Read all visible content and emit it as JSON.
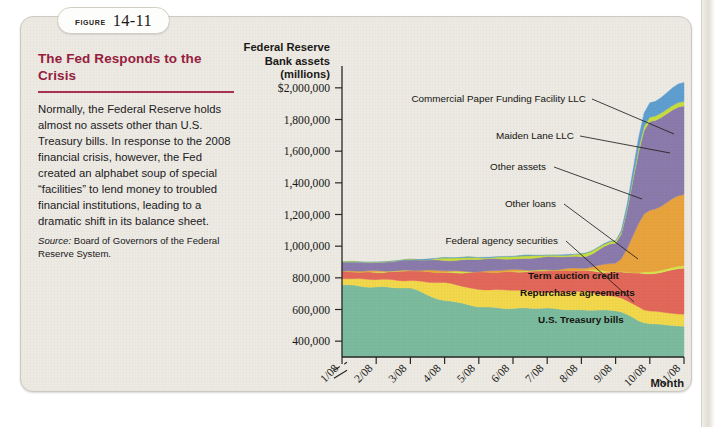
{
  "figure": {
    "label_word": "FIGURE",
    "number": "14-11"
  },
  "caption": {
    "title": "The Fed Responds to the Crisis",
    "body": "Normally, the Federal Reserve holds almost no assets other than U.S. Treasury bills. In response to the 2008 financial crisis, however, the Fed created an alphabet soup of special “facilities” to lend money to troubled financial institutions, leading to a dramatic shift in its balance sheet.",
    "source_word": "Source:",
    "source_text": " Board of Governors of the Federal Reserve System."
  },
  "chart_data": {
    "type": "area",
    "title": "",
    "ylabel": "Federal Reserve Bank assets (millions)",
    "ylabel_lines": [
      "Federal Reserve",
      "Bank assets",
      "(millions)"
    ],
    "xlabel": "Month",
    "ylim": [
      300000,
      2100000
    ],
    "yticks": [
      400000,
      600000,
      800000,
      1000000,
      1200000,
      1400000,
      1600000,
      1800000,
      2000000
    ],
    "ytick_labels": [
      "400,000",
      "600,000",
      "800,000",
      "1,000,000",
      "1,200,000",
      "1,400,000",
      "1,600,000",
      "1,800,000",
      "$2,000,000"
    ],
    "axis_break": true,
    "axis_break_note": "zigzag break on y-axis below 400,000",
    "grid": false,
    "legend_position": "inline-annotations",
    "categories": [
      "1/08",
      "2/08",
      "3/08",
      "4/08",
      "5/08",
      "6/08",
      "7/08",
      "8/08",
      "9/08",
      "10/08",
      "11/08"
    ],
    "x": [
      "1/08",
      "2/08",
      "3/08",
      "4/08",
      "5/08",
      "6/08",
      "7/08",
      "8/08",
      "9/08",
      "10/08",
      "11/08"
    ],
    "stacking": "stacked-area",
    "series": [
      {
        "name": "U.S. Treasury bills",
        "color": "#7cbb9e",
        "label_kind": "inside",
        "values": [
          755000,
          745000,
          730000,
          660000,
          615000,
          610000,
          605000,
          600000,
          590000,
          510000,
          495000
        ]
      },
      {
        "name": "Repurchase agreements",
        "color": "#f2d84a",
        "label_kind": "inside",
        "values": [
          45000,
          42000,
          55000,
          105000,
          115000,
          110000,
          105000,
          110000,
          95000,
          80000,
          75000
        ]
      },
      {
        "name": "Term auction credit",
        "color": "#e2685a",
        "label_kind": "inside",
        "values": [
          40000,
          50000,
          60000,
          70000,
          105000,
          120000,
          135000,
          140000,
          150000,
          235000,
          290000
        ]
      },
      {
        "name": "Federal agency securities",
        "color": "#d4e84a",
        "label_kind": "callout",
        "values": [
          2000,
          2000,
          2000,
          2000,
          2000,
          2000,
          2000,
          2000,
          3000,
          12000,
          16000
        ]
      },
      {
        "name": "Other loans",
        "color": "#e8a33d",
        "label_kind": "callout",
        "values": [
          2000,
          2000,
          4000,
          6000,
          6000,
          6000,
          6000,
          6000,
          60000,
          390000,
          450000
        ]
      },
      {
        "name": "Other assets",
        "color": "#8b7bac",
        "label_kind": "callout",
        "values": [
          55000,
          58000,
          62000,
          70000,
          72000,
          74000,
          76000,
          78000,
          120000,
          560000,
          560000
        ]
      },
      {
        "name": "Maiden Lane LLC",
        "color": "#c8dd3c",
        "label_kind": "callout",
        "values": [
          0,
          0,
          0,
          12000,
          14000,
          14000,
          14000,
          14000,
          16000,
          28000,
          28000
        ]
      },
      {
        "name": "Commercial Paper Funding Facility LLC",
        "color": "#5f9fd0",
        "label_kind": "callout",
        "values": [
          0,
          0,
          0,
          0,
          0,
          0,
          0,
          0,
          0,
          90000,
          120000
        ]
      }
    ],
    "annotations": [
      {
        "text": "Commercial Paper Funding Facility LLC",
        "target_series": "Commercial Paper Funding Facility LLC"
      },
      {
        "text": "Maiden Lane LLC",
        "target_series": "Maiden Lane LLC"
      },
      {
        "text": "Other assets",
        "target_series": "Other assets"
      },
      {
        "text": "Other loans",
        "target_series": "Other loans"
      },
      {
        "text": "Federal agency securities",
        "target_series": "Federal agency securities"
      },
      {
        "text": "Term auction credit",
        "target_series": "Term auction credit"
      },
      {
        "text": "Repurchase agreements",
        "target_series": "Repurchase agreements"
      },
      {
        "text": "U.S. Treasury bills",
        "target_series": "U.S. Treasury bills"
      }
    ]
  }
}
